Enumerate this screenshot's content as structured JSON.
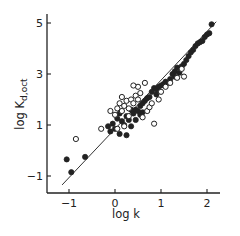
{
  "chart_data": {
    "type": "scatter",
    "title": "",
    "xlabel": "log k",
    "ylabel": "log K_d,oct",
    "ylabel_main": "log K",
    "ylabel_sub": "d,oct",
    "xlim": [
      -1.4,
      2.5
    ],
    "ylim": [
      -1.7,
      5.5
    ],
    "x_ticks": [
      -1,
      0,
      1,
      2
    ],
    "x_tick_labels": [
      "-1",
      "0",
      "1",
      "2"
    ],
    "y_ticks": [
      -1,
      1,
      3,
      5
    ],
    "y_tick_labels": [
      "-1",
      "1",
      "3",
      "5"
    ],
    "grid": false,
    "legend": null,
    "fit_line": {
      "x": [
        -1.15,
        2.2
      ],
      "y": [
        -1.35,
        5.05
      ]
    },
    "series": [
      {
        "name": "filled",
        "marker": "filled-circle",
        "points": [
          [
            -1.05,
            -0.35
          ],
          [
            -0.95,
            -0.85
          ],
          [
            -0.65,
            -0.25
          ],
          [
            -0.15,
            0.95
          ],
          [
            -0.1,
            0.75
          ],
          [
            -0.05,
            1.05
          ],
          [
            0.0,
            0.85
          ],
          [
            0.05,
            1.25
          ],
          [
            0.1,
            0.65
          ],
          [
            0.15,
            1.15
          ],
          [
            0.2,
            1.0
          ],
          [
            0.25,
            1.35
          ],
          [
            0.3,
            1.2
          ],
          [
            0.35,
            0.95
          ],
          [
            0.4,
            1.45
          ],
          [
            0.45,
            1.6
          ],
          [
            0.5,
            1.55
          ],
          [
            0.55,
            1.75
          ],
          [
            0.6,
            1.85
          ],
          [
            0.65,
            1.95
          ],
          [
            0.7,
            2.05
          ],
          [
            0.45,
            1.2
          ],
          [
            0.55,
            1.4
          ],
          [
            0.75,
            2.1
          ],
          [
            0.8,
            2.3
          ],
          [
            0.85,
            2.45
          ],
          [
            0.9,
            2.4
          ],
          [
            0.95,
            2.5
          ],
          [
            1.0,
            2.55
          ],
          [
            1.05,
            2.6
          ],
          [
            0.9,
            2.2
          ],
          [
            1.1,
            2.7
          ],
          [
            1.15,
            2.65
          ],
          [
            1.2,
            2.8
          ],
          [
            1.25,
            3.0
          ],
          [
            1.3,
            3.1
          ],
          [
            1.35,
            3.25
          ],
          [
            1.3,
            2.9
          ],
          [
            1.4,
            3.05
          ],
          [
            1.45,
            3.3
          ],
          [
            1.5,
            3.4
          ],
          [
            1.55,
            3.55
          ],
          [
            1.6,
            3.7
          ],
          [
            1.65,
            3.85
          ],
          [
            1.7,
            3.95
          ],
          [
            1.75,
            4.1
          ],
          [
            1.8,
            4.2
          ],
          [
            1.85,
            4.25
          ],
          [
            1.9,
            4.3
          ],
          [
            1.95,
            4.45
          ],
          [
            2.0,
            4.55
          ],
          [
            2.05,
            4.6
          ],
          [
            2.1,
            4.95
          ],
          [
            0.25,
            0.6
          ],
          [
            0.1,
            1.45
          ],
          [
            0.35,
            1.6
          ],
          [
            0.6,
            1.5
          ]
        ]
      },
      {
        "name": "open",
        "marker": "open-circle",
        "points": [
          [
            -0.85,
            0.45
          ],
          [
            -0.3,
            0.85
          ],
          [
            -0.1,
            1.55
          ],
          [
            0.0,
            1.4
          ],
          [
            0.05,
            1.65
          ],
          [
            0.1,
            1.85
          ],
          [
            0.15,
            1.55
          ],
          [
            0.2,
            1.75
          ],
          [
            0.25,
            1.95
          ],
          [
            0.3,
            1.65
          ],
          [
            0.35,
            2.0
          ],
          [
            0.4,
            1.85
          ],
          [
            0.45,
            2.15
          ],
          [
            0.5,
            2.0
          ],
          [
            0.55,
            2.25
          ],
          [
            0.3,
            1.35
          ],
          [
            0.2,
            0.95
          ],
          [
            0.05,
            0.85
          ],
          [
            0.6,
            1.3
          ],
          [
            0.7,
            1.55
          ],
          [
            0.75,
            1.7
          ],
          [
            0.8,
            1.85
          ],
          [
            0.85,
            1.05
          ],
          [
            0.95,
            2.0
          ],
          [
            1.0,
            2.3
          ],
          [
            1.1,
            2.5
          ],
          [
            1.2,
            2.65
          ],
          [
            1.35,
            2.85
          ],
          [
            1.45,
            3.2
          ],
          [
            1.5,
            2.9
          ],
          [
            0.5,
            2.5
          ],
          [
            0.4,
            2.55
          ],
          [
            0.65,
            2.65
          ],
          [
            0.15,
            2.1
          ]
        ]
      }
    ]
  },
  "axes": {
    "x_title": "log k",
    "y_title_main": "log K",
    "y_title_sub": "d,oct",
    "x_tick_labels": [
      "-1",
      "0",
      "1",
      "2"
    ],
    "y_tick_labels": [
      "-1",
      "1",
      "3",
      "5"
    ]
  }
}
